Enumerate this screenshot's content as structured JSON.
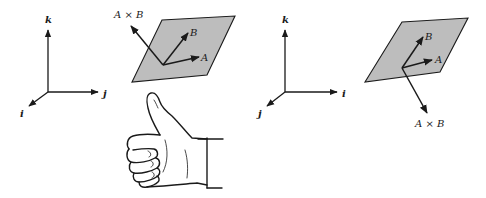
{
  "figure": {
    "left_panel": {
      "axes": {
        "up_label": "k",
        "right_label": "j",
        "out_label": "i"
      },
      "plane_vectors": {
        "a_label": "A",
        "b_label": "B",
        "cross_label": "A × B",
        "cross_direction": "up"
      },
      "illustration": "right-hand-thumbs-up"
    },
    "right_panel": {
      "axes": {
        "up_label": "k",
        "right_label": "i",
        "out_label": "j"
      },
      "plane_vectors": {
        "a_label": "A",
        "b_label": "B",
        "cross_label": "A × B",
        "cross_direction": "down"
      }
    },
    "colors": {
      "plane_fill": "#bdbdbd",
      "ink": "#1a1a1a",
      "background": "#ffffff"
    }
  }
}
